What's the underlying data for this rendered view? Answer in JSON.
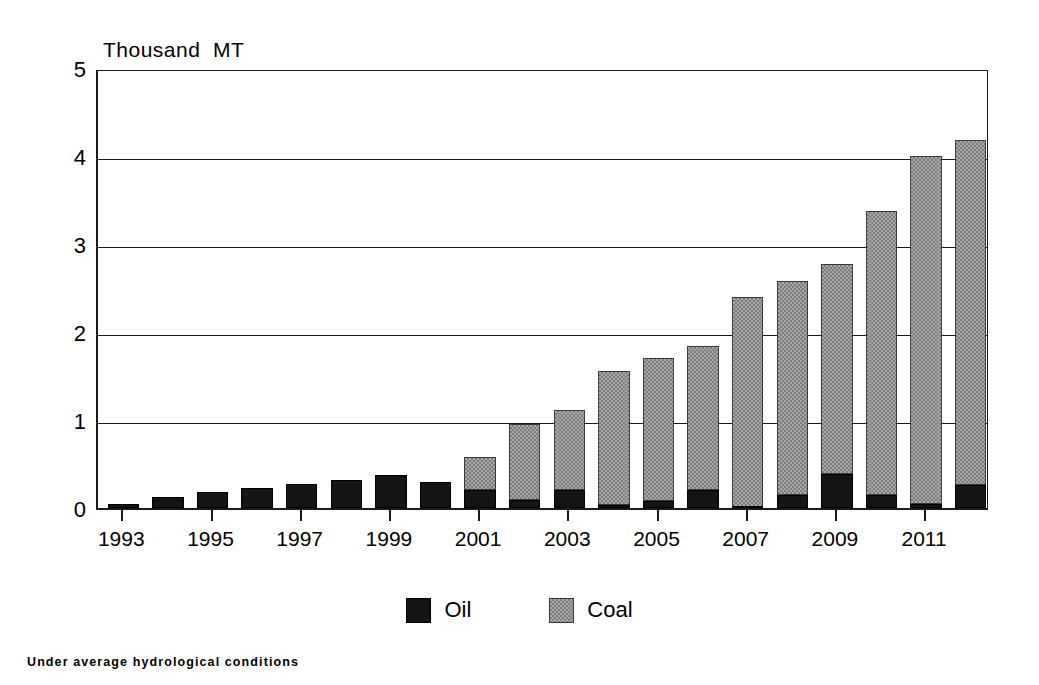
{
  "chart_data": {
    "type": "bar",
    "subtype": "stacked-vertical",
    "title": "",
    "axis_unit_label": "Thousand  MT",
    "xlabel": "",
    "ylabel": "Thousand MT",
    "ylim": [
      0,
      5
    ],
    "yticks": [
      0,
      1,
      2,
      3,
      4,
      5
    ],
    "ytick_labels": [
      "0",
      "1",
      "2",
      "3",
      "4",
      "5"
    ],
    "grid": true,
    "grid_axis": "y",
    "legend_position": "bottom-center",
    "footnote": "Under average hydrological conditions",
    "categories": [
      "1993",
      "1994",
      "1995",
      "1996",
      "1997",
      "1998",
      "1999",
      "2000",
      "2001",
      "2002",
      "2003",
      "2004",
      "2005",
      "2006",
      "2007",
      "2008",
      "2009",
      "2010",
      "2011",
      "2012"
    ],
    "xtick_labels": [
      "1993",
      "1995",
      "1997",
      "1999",
      "2001",
      "2003",
      "2005",
      "2007",
      "2009",
      "2011"
    ],
    "xtick_categories": [
      "1993",
      "1995",
      "1997",
      "1999",
      "2001",
      "2003",
      "2005",
      "2007",
      "2009",
      "2011"
    ],
    "series": [
      {
        "name": "Oil",
        "color": "#151515",
        "values": [
          0.05,
          0.13,
          0.18,
          0.23,
          0.27,
          0.32,
          0.37,
          0.3,
          0.2,
          0.09,
          0.21,
          0.03,
          0.08,
          0.2,
          0.01,
          0.15,
          0.39,
          0.15,
          0.04,
          0.26
        ]
      },
      {
        "name": "Coal",
        "color": "#a8a8a8",
        "values": [
          0.0,
          0.0,
          0.0,
          0.0,
          0.0,
          0.0,
          0.0,
          0.0,
          0.38,
          0.86,
          0.9,
          1.53,
          1.63,
          1.64,
          2.39,
          2.43,
          2.38,
          3.22,
          3.96,
          3.92
        ]
      }
    ],
    "totals": [
      0.05,
      0.13,
      0.18,
      0.23,
      0.27,
      0.32,
      0.37,
      0.3,
      0.58,
      0.95,
      1.11,
      1.56,
      1.71,
      1.84,
      2.4,
      2.58,
      2.77,
      3.37,
      4.0,
      4.18
    ]
  },
  "legend": {
    "items": [
      {
        "label": "Oil",
        "swatch": "black-square"
      },
      {
        "label": "Coal",
        "swatch": "gray-stipple-square"
      }
    ]
  }
}
